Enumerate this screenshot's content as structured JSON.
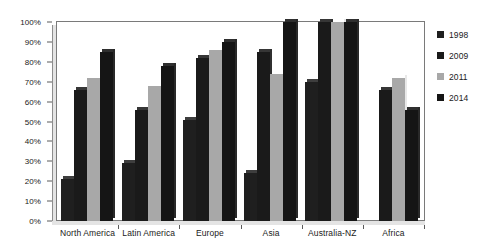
{
  "chart_data": {
    "type": "bar",
    "title": "",
    "subtitle": "",
    "xlabel": "",
    "ylabel": "",
    "ylim": [
      0,
      100
    ],
    "ytick_labels": [
      "0%",
      "10%",
      "20%",
      "30%",
      "40%",
      "50%",
      "60%",
      "70%",
      "80%",
      "90%",
      "100%"
    ],
    "ytick_values": [
      0,
      10,
      20,
      30,
      40,
      50,
      60,
      70,
      80,
      90,
      100
    ],
    "grid": false,
    "legend_position": "right",
    "value_unit": "%",
    "categories": [
      "North America",
      "Latin America",
      "Europe",
      "Asia",
      "Australia-NZ",
      "Africa"
    ],
    "series": [
      {
        "name": "1998",
        "color": "#1f1f1f",
        "values": [
          21,
          29,
          51,
          24,
          70,
          0
        ]
      },
      {
        "name": "2009",
        "color": "#1a1a1a",
        "values": [
          66,
          56,
          82,
          85,
          100,
          66
        ]
      },
      {
        "name": "2011",
        "color": "#a8a8a8",
        "values": [
          72,
          68,
          86,
          74,
          100,
          72
        ]
      },
      {
        "name": "2014",
        "color": "#151515",
        "values": [
          85,
          78,
          90,
          100,
          100,
          56
        ]
      }
    ]
  },
  "legend": {
    "items": [
      {
        "label": "1998",
        "color": "#1f1f1f"
      },
      {
        "label": "2009",
        "color": "#1a1a1a"
      },
      {
        "label": "2011",
        "color": "#a8a8a8"
      },
      {
        "label": "2014",
        "color": "#151515"
      }
    ]
  }
}
